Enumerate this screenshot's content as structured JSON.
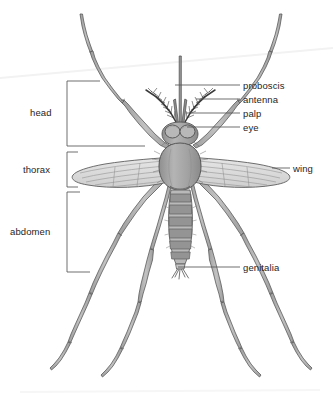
{
  "diagram": {
    "view": "dorsal",
    "background_color": "#ffffff",
    "ink_color": "#4a4a4a",
    "body_fill": "#a3a3a3",
    "body_fill_light": "#c9c9c9",
    "wing_fill": "#d8d8d8",
    "leg_fill": "#b0b0b0",
    "label_color": "#1e1e1e",
    "leader_color": "#555555"
  },
  "labels_right": [
    {
      "id": "proboscis",
      "text": "proboscis",
      "x": 243,
      "y": 81,
      "leader_from_x": 175,
      "leader_to_x": 240,
      "leader_y": 85
    },
    {
      "id": "antenna",
      "text": "antenna",
      "x": 243,
      "y": 95,
      "leader_from_x": 196,
      "leader_to_x": 240,
      "leader_y": 99
    },
    {
      "id": "palp",
      "text": "palp",
      "x": 243,
      "y": 109,
      "leader_from_x": 186,
      "leader_to_x": 240,
      "leader_y": 113
    },
    {
      "id": "eye",
      "text": "eye",
      "x": 243,
      "y": 123,
      "leader_from_x": 187,
      "leader_to_x": 240,
      "leader_y": 127
    },
    {
      "id": "wing",
      "text": "wing",
      "x": 293,
      "y": 164,
      "leader_from_x": 272,
      "leader_to_x": 290,
      "leader_y": 168
    },
    {
      "id": "genitalia",
      "text": "genitalia",
      "x": 243,
      "y": 263,
      "leader_from_x": 178,
      "leader_to_x": 240,
      "leader_y": 267
    }
  ],
  "labels_left": [
    {
      "id": "head",
      "text": "head",
      "x": 30,
      "y": 108
    },
    {
      "id": "thorax",
      "text": "thorax",
      "x": 23,
      "y": 165
    },
    {
      "id": "abdomen",
      "text": "abdomen",
      "x": 10,
      "y": 227
    }
  ],
  "brackets": [
    {
      "id": "head-bracket",
      "part": "head",
      "x": 67,
      "top_y": 81,
      "bottom_y": 146,
      "top_arm_x": 100,
      "bottom_arm_x": 145
    },
    {
      "id": "thorax-bracket",
      "part": "thorax",
      "x": 67,
      "top_y": 152,
      "bottom_y": 187,
      "top_arm_x": 78,
      "bottom_arm_x": 78
    },
    {
      "id": "abdomen-bracket",
      "part": "abdomen",
      "x": 67,
      "top_y": 192,
      "bottom_y": 272,
      "top_arm_x": 80,
      "bottom_arm_x": 90
    }
  ],
  "body_parts": [
    {
      "id": "proboscis",
      "name": "proboscis"
    },
    {
      "id": "antenna-left",
      "name": "antenna"
    },
    {
      "id": "antenna-right",
      "name": "antenna"
    },
    {
      "id": "palp-left",
      "name": "palp"
    },
    {
      "id": "palp-right",
      "name": "palp"
    },
    {
      "id": "eye-left",
      "name": "compound eye"
    },
    {
      "id": "eye-right",
      "name": "compound eye"
    },
    {
      "id": "head-capsule",
      "name": "head"
    },
    {
      "id": "thorax",
      "name": "thorax"
    },
    {
      "id": "abdomen",
      "name": "abdomen"
    },
    {
      "id": "genitalia",
      "name": "genitalia"
    },
    {
      "id": "wing-left",
      "name": "wing"
    },
    {
      "id": "wing-right",
      "name": "wing"
    },
    {
      "id": "leg-front-left",
      "name": "foreleg"
    },
    {
      "id": "leg-front-right",
      "name": "foreleg"
    },
    {
      "id": "leg-mid-left",
      "name": "midleg"
    },
    {
      "id": "leg-mid-right",
      "name": "midleg"
    },
    {
      "id": "leg-hind-left",
      "name": "hindleg"
    },
    {
      "id": "leg-hind-right",
      "name": "hindleg"
    }
  ],
  "abdomen_segments": 8
}
